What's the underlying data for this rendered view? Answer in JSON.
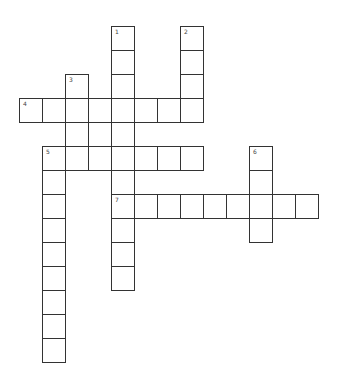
{
  "puzzle": {
    "type": "crossword",
    "cell_width": 23,
    "cell_height": 24,
    "origin_x": 19,
    "origin_y": 26,
    "line_color": "#333333",
    "cell_fill": "#ffffff",
    "entries": [
      {
        "number": "1",
        "direction": "down",
        "col": 4,
        "row": 0,
        "length": 11
      },
      {
        "number": "2",
        "direction": "down",
        "col": 7,
        "row": 0,
        "length": 4
      },
      {
        "number": "3",
        "direction": "down",
        "col": 2,
        "row": 2,
        "length": 4
      },
      {
        "number": "4",
        "direction": "across",
        "col": 0,
        "row": 3,
        "length": 8
      },
      {
        "number": "5",
        "direction": "across",
        "col": 1,
        "row": 5,
        "length": 7
      },
      {
        "number": "5",
        "direction": "down",
        "col": 1,
        "row": 5,
        "length": 9
      },
      {
        "number": "6",
        "direction": "down",
        "col": 10,
        "row": 5,
        "length": 4
      },
      {
        "number": "7",
        "direction": "across",
        "col": 4,
        "row": 7,
        "length": 9
      }
    ]
  }
}
